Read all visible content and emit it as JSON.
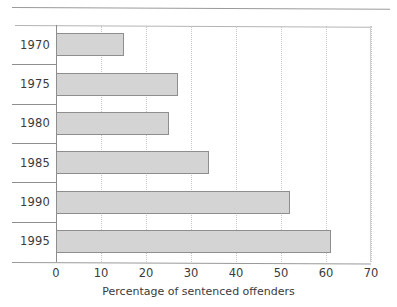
{
  "chart_data": {
    "type": "bar",
    "orientation": "horizontal",
    "title": "",
    "subtitle": "",
    "xlabel": "Percentage of sentenced offenders",
    "ylabel": "",
    "categories": [
      "1970",
      "1975",
      "1980",
      "1985",
      "1990",
      "1995"
    ],
    "values": [
      15,
      27,
      25,
      34,
      52,
      61
    ],
    "series": [
      {
        "name": "Percentage of sentenced offenders",
        "values": [
          15,
          27,
          25,
          34,
          52,
          61
        ]
      }
    ],
    "xlim": [
      0,
      70
    ],
    "xticks": [
      0,
      10,
      20,
      30,
      40,
      50,
      60,
      70
    ],
    "xtick_labels": [
      "0",
      "10",
      "20",
      "30",
      "40",
      "50",
      "60",
      "70"
    ],
    "grid": true,
    "grid_axis": "x",
    "grid_style": "dotted",
    "legend": false,
    "legend_position": "none",
    "bar_fill_color": "#d4d4d4",
    "bar_border_color": "#8e8e8e",
    "axis_color": "#8c8c8c",
    "grid_color": "#c8c8c8",
    "text_color": "#3b3b3b",
    "background_color": "#ffffff"
  },
  "figure": {
    "page_rule": "horizontal-rule"
  }
}
